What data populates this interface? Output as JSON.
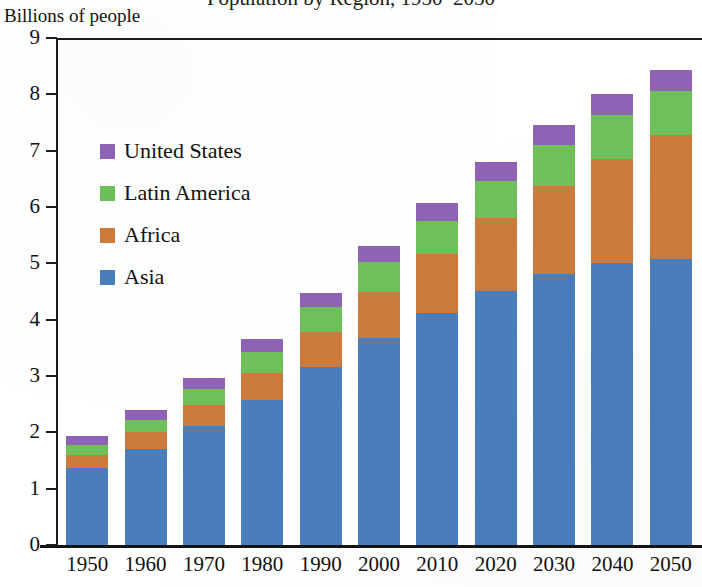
{
  "chart_data": {
    "type": "bar",
    "stacked": true,
    "title": "Population by Region, 1950–2050",
    "ylabel": "Billions of people",
    "xlabel": "",
    "ylim": [
      0,
      9
    ],
    "ytick_labels": [
      "0",
      "1",
      "2",
      "3",
      "4",
      "5",
      "6",
      "7",
      "8",
      "9"
    ],
    "ytick_values": [
      0,
      1,
      2,
      3,
      4,
      5,
      6,
      7,
      8,
      9
    ],
    "grid": false,
    "legend_position": "upper left inside plot",
    "categories": [
      "1950",
      "1960",
      "1970",
      "1980",
      "1990",
      "2000",
      "2010",
      "2020",
      "2030",
      "2040",
      "2050"
    ],
    "series": [
      {
        "name": "Asia",
        "color": "#4A7EBB",
        "values": [
          1.37,
          1.71,
          2.11,
          2.58,
          3.16,
          3.68,
          4.11,
          4.51,
          4.81,
          5.01,
          5.08
        ]
      },
      {
        "name": "Africa",
        "color": "#CC7B3C",
        "values": [
          0.23,
          0.29,
          0.37,
          0.48,
          0.63,
          0.82,
          1.05,
          1.29,
          1.57,
          1.85,
          2.2
        ]
      },
      {
        "name": "Latin America",
        "color": "#6FC05A",
        "values": [
          0.17,
          0.22,
          0.29,
          0.36,
          0.44,
          0.52,
          0.6,
          0.67,
          0.73,
          0.77,
          0.78
        ]
      },
      {
        "name": "United States",
        "color": "#8E63B5",
        "values": [
          0.16,
          0.18,
          0.2,
          0.23,
          0.25,
          0.28,
          0.31,
          0.33,
          0.35,
          0.37,
          0.38
        ]
      }
    ],
    "totals": [
      1.93,
      2.4,
      2.97,
      3.65,
      4.48,
      5.3,
      6.07,
      6.8,
      7.46,
      8.0,
      8.44
    ],
    "stack_order_bottom_to_top": [
      "Asia",
      "Africa",
      "Latin America",
      "United States"
    ],
    "legend_order_top_to_bottom": [
      "United States",
      "Latin America",
      "Africa",
      "Asia"
    ]
  }
}
